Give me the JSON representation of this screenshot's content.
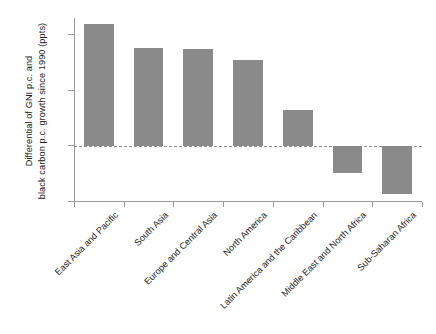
{
  "chart_data": {
    "type": "bar",
    "title": "",
    "xlabel": "",
    "ylabel": "Differential of GNI p.c. and black carbon p.c. growth since 1990 (ppts)",
    "ylabel_lines": [
      "Differential of GNI p.c. and",
      "black carbon p.c. growth since 1990 (ppts)"
    ],
    "categories": [
      "East Asia and Pacific",
      "South Asia",
      "Europe and Central Asia",
      "North America",
      "Latin America and the Caribbean",
      "Middle East and North Africa",
      "Sub-Saharan Africa"
    ],
    "values": [
      110,
      88,
      87,
      77,
      32,
      -25,
      -44
    ],
    "ylim": [
      -50,
      115
    ],
    "yticks": [
      -50,
      0,
      50,
      100
    ],
    "ytick_labels": [
      "−50",
      "0",
      "50",
      "100"
    ],
    "grid": false,
    "legend": null,
    "bar_color": "#8a8a8a",
    "zero_line_color": "#8d8d8d",
    "axis_color": "#9a9a9a",
    "text_color": "#1c1c1c"
  }
}
